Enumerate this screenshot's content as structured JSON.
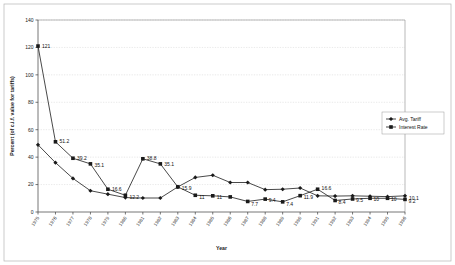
{
  "chart_data": {
    "type": "line",
    "title": "",
    "xlabel": "Year",
    "ylabel": "Percent (of c.i.f. value for tariffs)",
    "ylim": [
      0,
      140
    ],
    "yticks": [
      0,
      20,
      40,
      60,
      80,
      100,
      120,
      140
    ],
    "grid": true,
    "legend_position": "right",
    "categories": [
      "1975",
      "1976",
      "1977",
      "1978",
      "1979",
      "1980",
      "1981",
      "1982",
      "1983",
      "1984",
      "1985",
      "1986",
      "1987",
      "1988",
      "1989",
      "1990",
      "1991",
      "1992",
      "1993",
      "1994",
      "1995",
      "1996"
    ],
    "series": [
      {
        "name": "Avg. Tariff",
        "marker": "diamond",
        "values": [
          49,
          36,
          24.5,
          15.5,
          13,
          10.5,
          10.2,
          10.2,
          18.3,
          25.2,
          26.8,
          21.5,
          21.5,
          16.3,
          16.6,
          17.5,
          11.8,
          11.6,
          11.8,
          11.5,
          11.2,
          11.8
        ],
        "labels": [
          "",
          "",
          "",
          "",
          "",
          "",
          "",
          "",
          "",
          "",
          "",
          "",
          "",
          "",
          "",
          "",
          "",
          "",
          "",
          "",
          "",
          ""
        ]
      },
      {
        "name": "Interest Rate",
        "marker": "square",
        "values": [
          121,
          51.2,
          39.2,
          35.1,
          16.6,
          12.2,
          38.8,
          35.1,
          18.3,
          12.2,
          11.8,
          11,
          7.7,
          9.4,
          7.4,
          11.9,
          16.6,
          8.4,
          9.5,
          10,
          10,
          9.2
        ],
        "labels": [
          "121",
          "51.2",
          "39.2",
          "35.1",
          "16.6",
          "12.2",
          "38.8",
          "35.1",
          "15.9",
          "11",
          "11",
          "",
          "7.7",
          "9.4",
          "7.4",
          "11.9",
          "16.6",
          "8.4",
          "9.5",
          "10",
          "10",
          "9.2"
        ]
      }
    ],
    "trailing_label": "10.1",
    "legend_entries": [
      "Avg. Tariff",
      "Interest Rate"
    ]
  }
}
